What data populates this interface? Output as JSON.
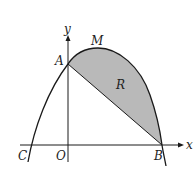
{
  "diagram": {
    "labels": {
      "y_axis": "y",
      "x_axis": "x",
      "origin": "O",
      "point_a": "A",
      "point_m": "M",
      "point_b": "B",
      "point_c": "C",
      "region": "R"
    },
    "colors": {
      "stroke": "#1a1a1a",
      "region_fill": "#b9b9b9",
      "background": "#ffffff"
    }
  }
}
